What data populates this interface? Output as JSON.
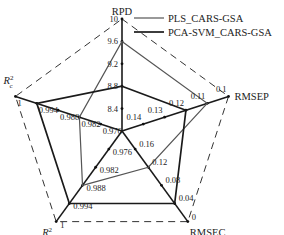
{
  "chart_data": {
    "type": "radar",
    "title": "",
    "axes": [
      {
        "name": "RPD",
        "label": "RPD",
        "range": [
          8.0,
          10.0
        ],
        "ticks": [
          8.4,
          8.8,
          9.2,
          9.6,
          10
        ],
        "tick_labels": [
          "8.4",
          "8.8",
          "9.2",
          "9.6",
          "10"
        ]
      },
      {
        "name": "RMSEP",
        "label": "RMSEP",
        "range": [
          0.15,
          0.1
        ],
        "ticks": [
          0.14,
          0.13,
          0.12,
          0.11,
          0.1
        ],
        "tick_labels": [
          "0.14",
          "0.13",
          "0.12",
          "0.11",
          "0.1"
        ]
      },
      {
        "name": "RMSEC",
        "label": "RMSEC",
        "range": [
          0.2,
          0.0
        ],
        "ticks": [
          0.16,
          0.12,
          0.08,
          0.04,
          0
        ],
        "tick_labels": [
          "0.16",
          "0.12",
          "0.08",
          "0.04",
          "0"
        ]
      },
      {
        "name": "Rp2",
        "label_main": "R",
        "label_sub": "p",
        "label_sup": "2",
        "range": [
          0.97,
          1.0
        ],
        "ticks": [
          0.976,
          0.982,
          0.988,
          0.994,
          1
        ],
        "tick_labels": [
          "0.976",
          "0.982",
          "0.988",
          "0.994",
          "1"
        ]
      },
      {
        "name": "Rc2",
        "label_main": "R",
        "label_sub": "c",
        "label_sup": "2",
        "range": [
          0.97,
          1.0
        ],
        "ticks": [
          0.976,
          0.982,
          0.988,
          0.994,
          1
        ],
        "tick_labels": [
          "0.976",
          "0.982",
          "0.988",
          "0.994",
          "1"
        ]
      }
    ],
    "series": [
      {
        "name": "PLS_CARS-GSA",
        "color": "#555555",
        "values": {
          "RPD": 9.6,
          "RMSEP": 0.11,
          "RMSEC": 0.12,
          "Rp2": 0.988,
          "Rc2": 0.982
        }
      },
      {
        "name": "PCA-SVM_CARS-GSA",
        "color": "#1a1a1a",
        "values": {
          "RPD": 8.8,
          "RMSEP": 0.12,
          "RMSEC": 0.04,
          "Rp2": 0.994,
          "Rc2": 0.994
        }
      }
    ],
    "outer_frame": "dashed",
    "legend_position": "top-right",
    "grid": false
  }
}
